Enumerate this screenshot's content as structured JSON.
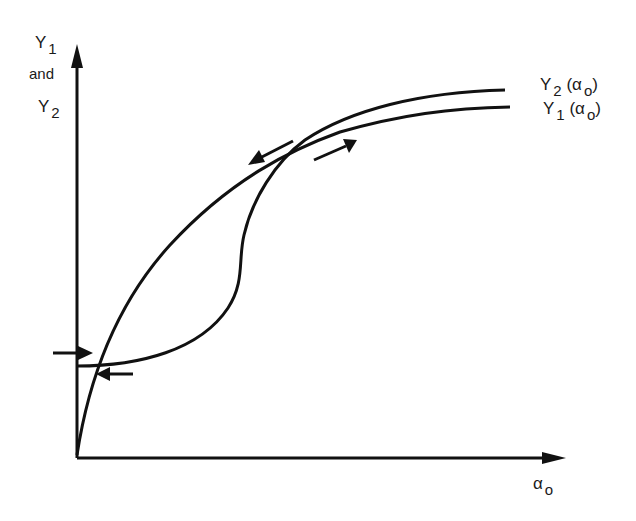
{
  "diagram": {
    "type": "hysteresis-curves",
    "y_axis": {
      "label_top": {
        "base": "Y",
        "sub": "1"
      },
      "label_mid": "and",
      "label_bottom": {
        "base": "Y",
        "sub": "2"
      }
    },
    "x_axis": {
      "label": {
        "base": "α",
        "sub": "o"
      }
    },
    "curves": [
      {
        "name": "Y2",
        "label": {
          "base": "Y",
          "sub": "2",
          "arg": "(α",
          "arg_sub": "o",
          "close": ")"
        }
      },
      {
        "name": "Y1",
        "label": {
          "base": "Y",
          "sub": "1",
          "arg": "(α",
          "arg_sub": "o",
          "close": ")"
        }
      }
    ],
    "arrows": [
      {
        "name": "upper-left-arrow",
        "direction": "down-left"
      },
      {
        "name": "upper-right-arrow",
        "direction": "up-right"
      },
      {
        "name": "lower-left-arrow",
        "direction": "right"
      },
      {
        "name": "lower-right-arrow",
        "direction": "left"
      }
    ],
    "colors": {
      "stroke": "#111111",
      "background": "#ffffff"
    }
  }
}
